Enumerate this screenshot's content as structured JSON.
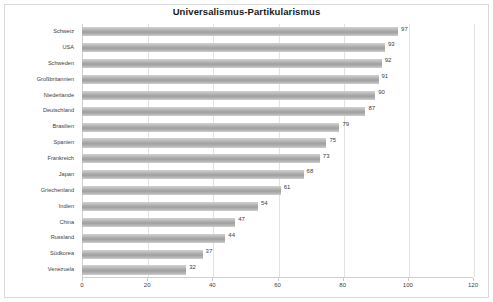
{
  "chart_data": {
    "type": "bar",
    "orientation": "horizontal",
    "title": "Universalismus-Partikularismus",
    "xlabel": "",
    "ylabel": "",
    "categories": [
      "Schweiz",
      "USA",
      "Schweden",
      "Großbritannien",
      "Niederlande",
      "Deutschland",
      "Brasilien",
      "Spanien",
      "Frankreich",
      "Japan",
      "Griechenland",
      "Indien",
      "China",
      "Russland",
      "Südkorea",
      "Venezuela"
    ],
    "values": [
      97,
      93,
      92,
      91,
      90,
      87,
      79,
      75,
      73,
      68,
      61,
      54,
      47,
      44,
      37,
      32
    ],
    "xlim": [
      0,
      120
    ],
    "xticks": [
      0,
      20,
      40,
      60,
      80,
      100,
      120
    ],
    "xtick_labels": [
      "0",
      "20",
      "40",
      "60",
      "80",
      "100",
      "120"
    ],
    "grid": "vertical",
    "legend": "none",
    "data_labels": true,
    "bar_color": "#a9a9a9",
    "grid_color": "#e2e2e2",
    "text_color": "#3d3d3d"
  }
}
